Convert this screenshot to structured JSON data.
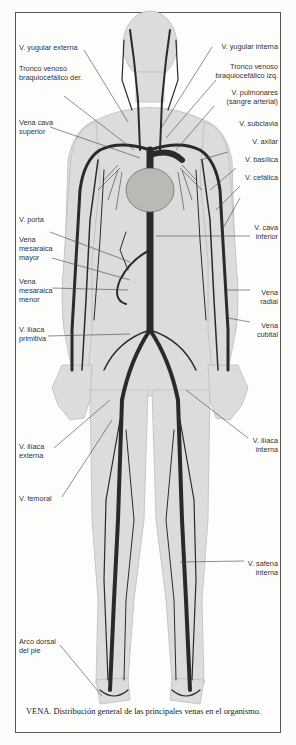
{
  "figure": {
    "colors": {
      "vein": "#2a2a2a",
      "body": "#d9d9d7",
      "body_shade": "#c6c6c3",
      "frame": "#555555",
      "background": "#fdfdfc"
    }
  },
  "labels_left": [
    {
      "id": "yugular-externa",
      "text": "V. yugular externa"
    },
    {
      "id": "tronco-braquiocefalico-der",
      "text": "Tronco venoso\nbraquiocefálico der."
    },
    {
      "id": "vena-cava-superior",
      "text": "Vena cava\nsuperior"
    },
    {
      "id": "porta",
      "text": "V. porta"
    },
    {
      "id": "mesaraica-mayor",
      "text": "Vena\nmesaraica\nmayor"
    },
    {
      "id": "mesaraica-menor",
      "text": "Vena\nmesaraica\nmenor"
    },
    {
      "id": "iliaca-primitiva",
      "text": "V. ilíaca\nprimitiva"
    },
    {
      "id": "iliaca-externa",
      "text": "V. ilíaca\nexterna"
    },
    {
      "id": "femoral",
      "text": "V. femoral"
    },
    {
      "id": "arco-dorsal-pie",
      "text": "Arco dorsal\ndel pie"
    }
  ],
  "labels_right": [
    {
      "id": "yugular-interna",
      "text": "V. yugular interna"
    },
    {
      "id": "tronco-braquiocefalico-izq",
      "text": "Tronco venoso\nbraquiocefálico izq."
    },
    {
      "id": "pulmonares",
      "text": "V. pulmonares\n(sangre arterial)"
    },
    {
      "id": "subclavia",
      "text": "V. subclavia"
    },
    {
      "id": "axilar",
      "text": "V. axilar"
    },
    {
      "id": "basilica",
      "text": "V. basílica"
    },
    {
      "id": "cefalica",
      "text": "V. cefálica"
    },
    {
      "id": "cava-inferior",
      "text": "V. cava\ninferior"
    },
    {
      "id": "radial",
      "text": "Vena\nradial"
    },
    {
      "id": "cubital",
      "text": "Vena\ncubital"
    },
    {
      "id": "iliaca-interna",
      "text": "V. ilíaca\ninterna"
    },
    {
      "id": "safena-interna",
      "text": "V. safena\ninterna"
    }
  ],
  "caption": {
    "bold": "VENA.",
    "text": " Distribución general de las principales venas en el organismo."
  }
}
